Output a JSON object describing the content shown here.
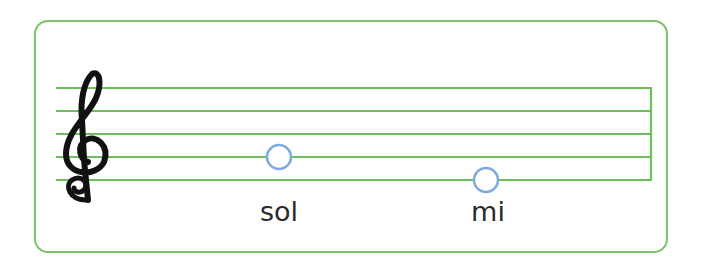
{
  "diagram": {
    "type": "music-staff",
    "clef": "treble-clef",
    "staff_lines": 5,
    "colors": {
      "frame": "#7cc46a",
      "staff_line": "#6cbf5a",
      "note_outline": "#7fa8e0",
      "clef": "#111111",
      "label": "#2a2a2a"
    },
    "notes": [
      {
        "name": "sol",
        "position": "on second line from bottom"
      },
      {
        "name": "mi",
        "position": "on bottom line"
      }
    ]
  }
}
